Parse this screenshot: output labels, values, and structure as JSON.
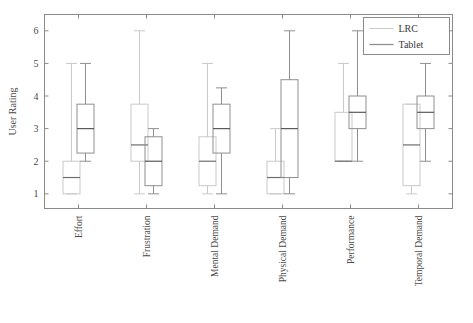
{
  "chart_data": {
    "type": "box",
    "title": "",
    "xlabel": "",
    "ylabel": "User Rating",
    "ylim": [
      0.55,
      6.5
    ],
    "yticks": [
      1,
      2,
      3,
      4,
      5,
      6
    ],
    "ytick_labels": [
      "1",
      "2",
      "3",
      "4",
      "5",
      "6"
    ],
    "grid": false,
    "legend_position": "top-right",
    "categories": [
      "Effort",
      "Frustration",
      "Mental Demand",
      "Physical Demand",
      "Performance",
      "Temporal Demand"
    ],
    "series": [
      {
        "name": "LRC",
        "color": "#c9c9c9",
        "boxes": [
          {
            "category": "Effort",
            "whisker_low": 1.0,
            "q1": 1.0,
            "median": 1.5,
            "q3": 2.0,
            "whisker_high": 5.0
          },
          {
            "category": "Frustration",
            "whisker_low": 1.0,
            "q1": 2.0,
            "median": 2.5,
            "q3": 3.75,
            "whisker_high": 6.0
          },
          {
            "category": "Mental Demand",
            "whisker_low": 1.0,
            "q1": 1.25,
            "median": 2.0,
            "q3": 2.75,
            "whisker_high": 5.0
          },
          {
            "category": "Physical Demand",
            "whisker_low": 1.0,
            "q1": 1.0,
            "median": 1.5,
            "q3": 2.0,
            "whisker_high": 3.0
          },
          {
            "category": "Performance",
            "whisker_low": 2.0,
            "q1": 2.0,
            "median": 2.0,
            "q3": 3.5,
            "whisker_high": 5.0
          },
          {
            "category": "Temporal Demand",
            "whisker_low": 1.0,
            "q1": 1.25,
            "median": 2.5,
            "q3": 3.75,
            "whisker_high": 3.75
          }
        ]
      },
      {
        "name": "Tablet",
        "color": "#8f8f8f",
        "boxes": [
          {
            "category": "Effort",
            "whisker_low": 2.0,
            "q1": 2.25,
            "median": 3.0,
            "q3": 3.75,
            "whisker_high": 5.0
          },
          {
            "category": "Frustration",
            "whisker_low": 1.0,
            "q1": 1.25,
            "median": 2.0,
            "q3": 2.75,
            "whisker_high": 3.0
          },
          {
            "category": "Mental Demand",
            "whisker_low": 1.0,
            "q1": 2.25,
            "median": 3.0,
            "q3": 3.75,
            "whisker_high": 4.25
          },
          {
            "category": "Physical Demand",
            "whisker_low": 1.0,
            "q1": 1.5,
            "median": 3.0,
            "q3": 4.5,
            "whisker_high": 6.0
          },
          {
            "category": "Performance",
            "whisker_low": 2.0,
            "q1": 3.0,
            "median": 3.5,
            "q3": 4.0,
            "whisker_high": 6.0
          },
          {
            "category": "Temporal Demand",
            "whisker_low": 2.0,
            "q1": 3.0,
            "median": 3.5,
            "q3": 4.0,
            "whisker_high": 5.0
          }
        ]
      }
    ],
    "legend": [
      {
        "label": "LRC",
        "color": "#c9c9c9"
      },
      {
        "label": "Tablet",
        "color": "#8f8f8f"
      }
    ]
  },
  "axes": {
    "frame_color": "#8a8a8a"
  }
}
